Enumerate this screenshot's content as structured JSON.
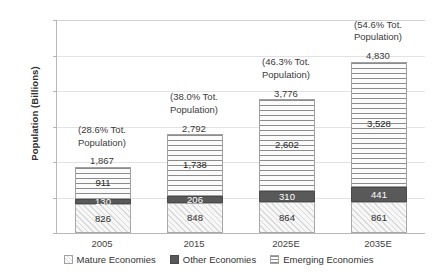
{
  "chart_data": {
    "type": "bar",
    "subtype": "stacked-vertical-bar",
    "title": "",
    "xlabel": "",
    "ylabel": "Population (Billions)",
    "ylim": [
      0,
      6000
    ],
    "ytick_labels": [
      "0",
      "1,000",
      "2,000",
      "3,000",
      "4,000",
      "5,000",
      "6,000"
    ],
    "ytick_values": [
      0,
      1000,
      2000,
      3000,
      4000,
      5000,
      6000
    ],
    "grid": true,
    "grid_axis": "y",
    "legend_position": "bottom",
    "categories": [
      "2005",
      "2015",
      "2025E",
      "2035E"
    ],
    "series": [
      {
        "name": "Mature Economies",
        "pattern": "diagonal",
        "color": "#f2f2f2",
        "values": [
          826,
          848,
          864,
          861
        ],
        "value_labels": [
          "826",
          "848",
          "864",
          "861"
        ]
      },
      {
        "name": "Other Economies",
        "pattern": "solid",
        "color": "#595959",
        "values": [
          130,
          206,
          310,
          441
        ],
        "value_labels": [
          "130",
          "206",
          "310",
          "441"
        ]
      },
      {
        "name": "Emerging Economies",
        "pattern": "horizontal",
        "color": "#fbfbfb",
        "values": [
          911,
          1738,
          2602,
          3528
        ],
        "value_labels": [
          "911",
          "1,738",
          "2,602",
          "3,528"
        ]
      }
    ],
    "totals": [
      1867,
      2792,
      3776,
      4830
    ],
    "total_labels": [
      "1,867",
      "2,792",
      "3,776",
      "4,830"
    ],
    "annotations": [
      "(28.6% Tot. Population)",
      "(38.0% Tot. Population)",
      "(46.3% Tot. Population)",
      "(54.6% Tot. Population)"
    ],
    "annotation_lines": [
      [
        "(28.6% Tot.",
        "Population)"
      ],
      [
        "(38.0% Tot.",
        "Population)"
      ],
      [
        "(46.3% Tot.",
        "Population)"
      ],
      [
        "(54.6% Tot.",
        "Population)"
      ]
    ]
  },
  "axis": {
    "y_title": "Population (Billions)"
  },
  "legend": {
    "items": [
      {
        "label": "Mature Economies",
        "pattern": "diagonal"
      },
      {
        "label": "Other Economies",
        "pattern": "solid"
      },
      {
        "label": "Emerging Economies",
        "pattern": "horizontal"
      }
    ]
  }
}
